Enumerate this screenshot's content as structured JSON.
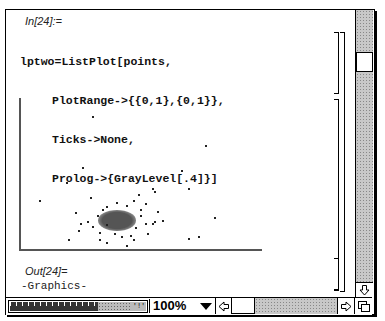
{
  "window": {
    "zoom_level": "100%"
  },
  "notebook": {
    "input_cell": {
      "label": "In[24]:=",
      "code_lines": [
        "lptwo=ListPlot[points,",
        "PlotRange->{{0,1},{0,1}},",
        "Ticks->None,",
        "Prolog->{GrayLevel[.4]}]"
      ]
    },
    "output_cell": {
      "label": "Out[24]=",
      "value": "-Graphics-"
    }
  },
  "scrollbars": {
    "vertical": {
      "thumb_position_pct": 15
    },
    "horizontal": {
      "thumb_position_pct": 0
    }
  },
  "icons": {
    "scroll_down": "arrow-down-outline",
    "scroll_left": "arrow-left-outline",
    "scroll_right": "arrow-right-outline",
    "zoom_dropdown": "triangle-down",
    "size_box": "overlapping-squares"
  },
  "colors": {
    "axis": "#555555",
    "point": "#222222",
    "scroll_track": "#c8c8c8"
  },
  "chart_data": {
    "type": "scatter",
    "title": "",
    "xlabel": "",
    "ylabel": "",
    "xlim": [
      0,
      1
    ],
    "ylim": [
      0,
      1
    ],
    "ticks": "none",
    "grid": false,
    "dense_cluster": {
      "center": [
        0.4,
        0.19
      ],
      "radius_x": 0.08,
      "radius_y": 0.07
    },
    "points": [
      [
        0.3,
        0.88
      ],
      [
        0.26,
        0.54
      ],
      [
        0.19,
        0.44
      ],
      [
        0.08,
        0.32
      ],
      [
        0.67,
        0.52
      ],
      [
        0.77,
        0.69
      ],
      [
        0.7,
        0.4
      ],
      [
        0.81,
        0.21
      ],
      [
        0.74,
        0.08
      ],
      [
        0.7,
        0.07
      ],
      [
        0.55,
        0.4
      ],
      [
        0.56,
        0.38
      ],
      [
        0.49,
        0.36
      ],
      [
        0.29,
        0.34
      ],
      [
        0.23,
        0.24
      ],
      [
        0.24,
        0.12
      ],
      [
        0.2,
        0.06
      ],
      [
        0.33,
        0.06
      ],
      [
        0.36,
        0.04
      ],
      [
        0.44,
        0.02
      ],
      [
        0.47,
        0.06
      ],
      [
        0.53,
        0.1
      ],
      [
        0.56,
        0.18
      ],
      [
        0.59,
        0.19
      ],
      [
        0.55,
        0.17
      ],
      [
        0.36,
        0.28
      ],
      [
        0.4,
        0.31
      ],
      [
        0.44,
        0.29
      ],
      [
        0.47,
        0.32
      ],
      [
        0.52,
        0.3
      ],
      [
        0.32,
        0.22
      ],
      [
        0.3,
        0.15
      ],
      [
        0.33,
        0.11
      ],
      [
        0.39,
        0.1
      ],
      [
        0.42,
        0.08
      ],
      [
        0.5,
        0.22
      ],
      [
        0.52,
        0.17
      ],
      [
        0.48,
        0.14
      ],
      [
        0.46,
        0.09
      ],
      [
        0.36,
        0.16
      ],
      [
        0.34,
        0.26
      ],
      [
        0.28,
        0.18
      ],
      [
        0.25,
        0.17
      ],
      [
        0.5,
        0.26
      ],
      [
        0.57,
        0.25
      ]
    ]
  }
}
